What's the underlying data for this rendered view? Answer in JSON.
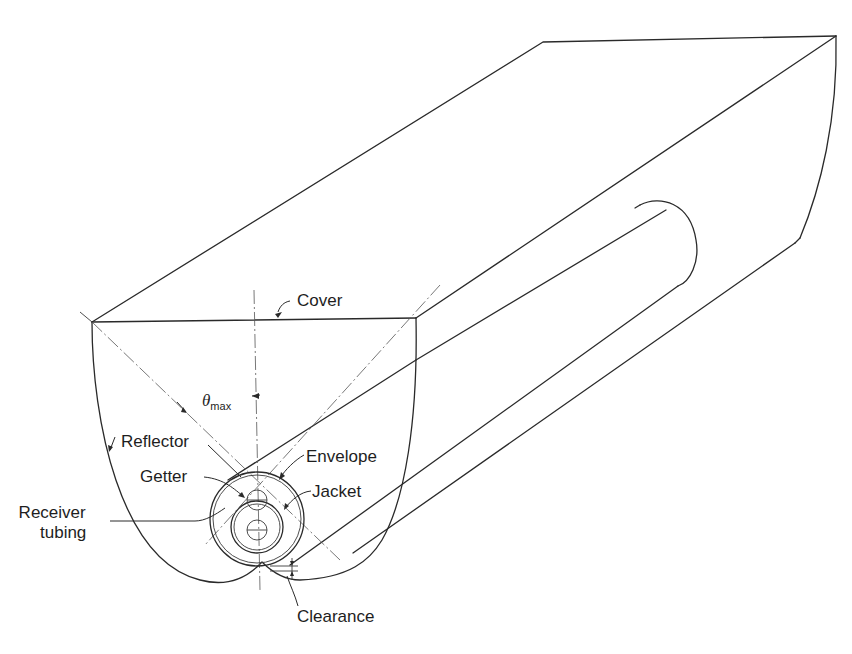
{
  "diagram": {
    "colors": {
      "ink": "#2a2a2a",
      "background": "#ffffff"
    },
    "labels": {
      "cover": "Cover",
      "theta_symbol": "θ",
      "theta_subscript": "max",
      "reflector": "Reflector",
      "envelope": "Envelope",
      "getter": "Getter",
      "jacket": "Jacket",
      "receiver_line1": "Receiver",
      "receiver_line2": "tubing",
      "clearance": "Clearance"
    }
  }
}
